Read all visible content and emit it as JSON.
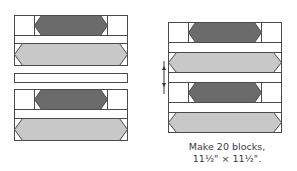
{
  "diagram": {
    "colors": {
      "outline": "#4a4a4a",
      "background_fabric": "#ffffff",
      "dark_fabric": "#6b6b6b",
      "light_fabric": "#c8c8c8"
    },
    "left_assembly": {
      "units": [
        "hexagon-unit-top",
        "sashing-strip",
        "hexagon-unit-bottom"
      ]
    },
    "right_assembly": {
      "rows": [
        "dark-hexagon",
        "strip",
        "light-hexagon",
        "strip",
        "dark-hexagon",
        "strip",
        "light-hexagon"
      ],
      "press_arrows": "up-and-down"
    },
    "caption": {
      "line1": "Make 20 blocks,",
      "line2": "11½\" × 11½\"."
    }
  }
}
